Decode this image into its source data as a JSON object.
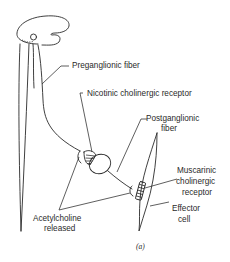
{
  "figure": {
    "caption": "(a)",
    "labels": {
      "preganglionic": "Preganglionic fiber",
      "nicotinic": "Nicotinic cholinergic receptor",
      "postganglionic_line1": "Postganglionic",
      "postganglionic_line2": "fiber",
      "muscarinic_line1": "Muscarinic",
      "muscarinic_line2": "cholinergic",
      "muscarinic_line3": "receptor",
      "effector_line1": "Effector",
      "effector_line2": "cell",
      "acetylcholine_line1": "Acetylcholine",
      "acetylcholine_line2": "released"
    },
    "colors": {
      "ink": "#2a2a2a",
      "background": "#ffffff"
    }
  }
}
